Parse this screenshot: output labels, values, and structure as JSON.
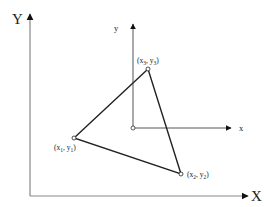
{
  "diagram": {
    "type": "coordinate-frames-triangle",
    "global_frame": {
      "x_label": "X",
      "y_label": "Y",
      "origin": [
        30,
        196
      ],
      "x_tip": [
        250,
        196
      ],
      "y_tip": [
        30,
        12
      ],
      "color": "#888888"
    },
    "local_frame": {
      "x_label": "x",
      "y_label": "y",
      "origin": [
        133,
        128
      ],
      "x_tip": [
        233,
        128
      ],
      "y_tip": [
        133,
        22
      ],
      "color": "#555555"
    },
    "triangle": {
      "edge_color": "#222222",
      "vertices": [
        {
          "id": "p1",
          "pos": [
            74,
            138
          ],
          "label_x": "x",
          "label_y": "y",
          "sub": "1",
          "label_pos": [
            56,
            151
          ]
        },
        {
          "id": "p2",
          "pos": [
            181,
            174
          ],
          "label_x": "x",
          "label_y": "y",
          "sub": "2",
          "label_pos": [
            188,
            177
          ]
        },
        {
          "id": "p3",
          "pos": [
            148,
            69
          ],
          "label_x": "x",
          "label_y": "y",
          "sub": "3",
          "label_pos": [
            146,
            63
          ]
        }
      ]
    },
    "text": {
      "Y": "Y",
      "X": "X",
      "y": "y",
      "x": "x",
      "open": "(",
      "comma": ", ",
      "close": ")",
      "p1_x": "x",
      "p1_sub1": "1",
      "p1_y": "y",
      "p1_sub2": "1",
      "p2_x": "x",
      "p2_sub1": "2",
      "p2_y": "y",
      "p2_sub2": "2",
      "p3_x": "x",
      "p3_sub1": "3",
      "p3_y": "y",
      "p3_sub2": "3"
    }
  }
}
